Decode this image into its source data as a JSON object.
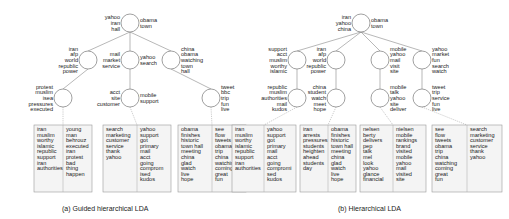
{
  "figure": {
    "captions": {
      "a": "(a) Guided hierarchical LDA",
      "b": "(b) Hierarchical LDA"
    },
    "tree_a": {
      "root": {
        "left": [
          "yahoo",
          "iran",
          "hall"
        ],
        "right": [
          "obama",
          "town"
        ]
      },
      "level1": [
        {
          "left": [
            "iran",
            "afp",
            "world",
            "republic",
            "power"
          ],
          "right": []
        },
        {
          "left": [
            "mail",
            "market",
            "service"
          ],
          "right": [
            "yahoo",
            "search"
          ]
        },
        {
          "left": [],
          "right": [
            "china",
            "obama",
            "watching",
            "town",
            "hall"
          ]
        }
      ],
      "level2": [
        {
          "left": [
            "protest",
            "muslim",
            "isea",
            "pressures",
            "executed"
          ],
          "right": []
        },
        {
          "left": [
            "acct",
            "site",
            "customer"
          ],
          "right": [
            "mobile",
            "support"
          ]
        },
        {
          "left": [],
          "right": [
            "tweet",
            "bbc",
            "trip",
            "fun",
            "live"
          ]
        }
      ],
      "leaves": [
        [
          [
            "iran",
            "muslim",
            "worthy",
            "islamic",
            "republic",
            "support",
            "iran",
            "authorities"
          ],
          [
            "young",
            "man",
            "behrouz",
            "executed",
            "iran",
            "protest",
            "bad",
            "thing",
            "happen"
          ]
        ],
        [
          [
            "search",
            "marketing",
            "customer",
            "service",
            "thank",
            "yahoo"
          ],
          [
            "yahoo",
            "support",
            "got",
            "primary",
            "mail",
            "acct",
            "going",
            "comprom",
            "ised",
            "kudos"
          ]
        ],
        [
          [
            "obama",
            "finishes",
            "historic",
            "town hall",
            "meeting",
            "china",
            "glad",
            "watch",
            "live",
            "hope"
          ],
          [
            "see",
            "flow",
            "tweets",
            "obama",
            "trip",
            "china",
            "watching",
            "coming",
            "great",
            "fun"
          ]
        ]
      ]
    },
    "tree_b": {
      "root": {
        "left": [
          "iran",
          "yahoo",
          "china"
        ],
        "right": [
          "obama",
          "town"
        ]
      },
      "level1": [
        {
          "left": [
            "support",
            "acct",
            "muslim",
            "worthy",
            "islamic"
          ],
          "right": []
        },
        {
          "left": [
            "iran",
            "afp",
            "world",
            "republic",
            "power"
          ],
          "right": []
        },
        {
          "left": [],
          "right": [
            "mobile",
            "yahoo",
            "mail",
            "visit",
            "site"
          ]
        },
        {
          "left": [],
          "right": [
            "yahoo",
            "market",
            "fun",
            "search",
            "watch"
          ]
        }
      ],
      "level2": [
        {
          "left": [
            "republic",
            "muslim",
            "authorities",
            "mail",
            "kudos"
          ],
          "right": []
        },
        {
          "left": [
            "china",
            "student",
            "watch",
            "meet",
            "hope"
          ],
          "right": []
        },
        {
          "left": [],
          "right": [
            "mobile",
            "talk",
            "yahoo",
            "site",
            "deliver"
          ]
        },
        {
          "left": [],
          "right": [
            "tweet",
            "trip",
            "service",
            "fun",
            "live"
          ]
        }
      ],
      "leaves": [
        [
          [
            "iran",
            "muslim",
            "worthy",
            "islamic",
            "republic",
            "support",
            "iran",
            "authorities"
          ],
          [
            "yahoo",
            "support",
            "got",
            "primary",
            "mail",
            "acct",
            "going",
            "compromi",
            "sed",
            "kudos"
          ]
        ],
        [
          [
            "iran",
            "arrests",
            "pressures",
            "students",
            "heighten",
            "ahead",
            "students",
            "day"
          ],
          [
            "obama",
            "finishes",
            "historic",
            "town hall",
            "meeting",
            "china",
            "glad",
            "watch",
            "live",
            "hope"
          ]
        ],
        [
          [
            "nelsen",
            "berty",
            "delivers",
            "pep",
            "talk",
            "mel",
            "look",
            "yahoo",
            "glance",
            "financial"
          ],
          [
            "nielsen",
            "mobile",
            "rankings",
            "brand",
            "visited",
            "mobile",
            "yahoo",
            "mail",
            "visited",
            "site"
          ]
        ],
        [
          [
            "see",
            "flow",
            "tweets",
            "obama",
            "trip",
            "china",
            "watching",
            "coming",
            "great",
            "fun"
          ],
          [
            "search",
            "marketing",
            "customer",
            "service",
            "thank",
            "yahoo"
          ]
        ]
      ]
    }
  }
}
